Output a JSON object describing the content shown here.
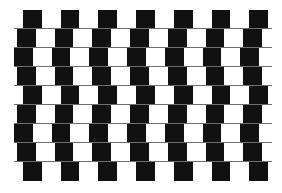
{
  "figure": {
    "name": "cafe-wall-illusion",
    "background_color": "#ffffff",
    "tile_color": "#111111",
    "mortar_color": "#6e6e6e",
    "rows": 9,
    "tiles_per_row": 7,
    "tile_width": 18.8,
    "tile_period": 37.7,
    "row_height": 19,
    "first_row_top": 10,
    "row_offsets": [
      23,
      17,
      14,
      17,
      23,
      17,
      14,
      17,
      23
    ],
    "mortar_left": 14,
    "mortar_right": 272
  }
}
